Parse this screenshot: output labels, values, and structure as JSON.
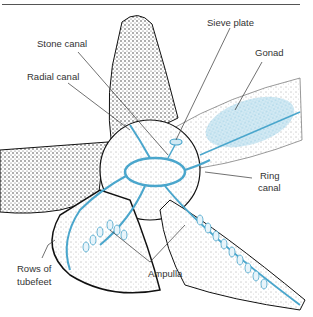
{
  "figure": {
    "labels": {
      "sieve_plate": "Sieve plate",
      "stone_canal": "Stone canal",
      "gonad": "Gonad",
      "radial_canal": "Radial canal",
      "ring_canal_line1": "Ring",
      "ring_canal_line2": "canal",
      "rows_tubefeet_line1": "Rows of",
      "rows_tubefeet_line2": "tubefeet",
      "ampulla": "Ampulla"
    },
    "colors": {
      "canal_blue": "#8cc8e0",
      "canal_stroke": "#4aa6cc",
      "body_stipple": "#2a2a2a",
      "leader_line": "#333333"
    }
  }
}
